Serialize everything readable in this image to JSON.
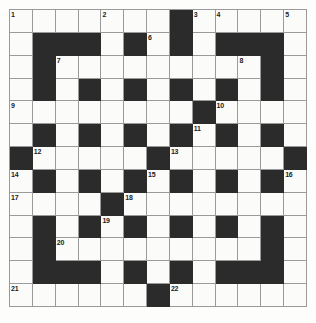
{
  "puzzle": {
    "title": "Crossword Grid",
    "type": "crossword",
    "rows": 13,
    "cols": 13,
    "cell_size": 22.85,
    "colors": {
      "block": "#2b2b2b",
      "open": "#fbfbfa",
      "grid_line": "#9a9a9a",
      "number": "#1b1b1b",
      "page_background": "#fdfdfc"
    },
    "block_count": 69,
    "numbered_cell_count": 22,
    "blocks": [
      [
        0,
        7
      ],
      [
        1,
        1
      ],
      [
        1,
        2
      ],
      [
        1,
        3
      ],
      [
        1,
        5
      ],
      [
        1,
        7
      ],
      [
        1,
        9
      ],
      [
        1,
        10
      ],
      [
        1,
        11
      ],
      [
        2,
        1
      ],
      [
        2,
        11
      ],
      [
        3,
        1
      ],
      [
        3,
        3
      ],
      [
        3,
        5
      ],
      [
        3,
        7
      ],
      [
        3,
        9
      ],
      [
        3,
        11
      ],
      [
        4,
        8
      ],
      [
        5,
        1
      ],
      [
        5,
        3
      ],
      [
        5,
        5
      ],
      [
        5,
        7
      ],
      [
        5,
        9
      ],
      [
        5,
        11
      ],
      [
        6,
        0
      ],
      [
        6,
        6
      ],
      [
        6,
        12
      ],
      [
        7,
        1
      ],
      [
        7,
        3
      ],
      [
        7,
        5
      ],
      [
        7,
        7
      ],
      [
        7,
        9
      ],
      [
        7,
        11
      ],
      [
        8,
        4
      ],
      [
        9,
        1
      ],
      [
        9,
        3
      ],
      [
        9,
        5
      ],
      [
        9,
        7
      ],
      [
        9,
        9
      ],
      [
        9,
        11
      ],
      [
        10,
        1
      ],
      [
        10,
        11
      ],
      [
        11,
        1
      ],
      [
        11,
        2
      ],
      [
        11,
        3
      ],
      [
        11,
        5
      ],
      [
        11,
        7
      ],
      [
        11,
        9
      ],
      [
        11,
        10
      ],
      [
        11,
        11
      ],
      [
        12,
        6
      ]
    ],
    "numbers": [
      {
        "n": "1",
        "row": 0,
        "col": 0
      },
      {
        "n": "2",
        "row": 0,
        "col": 4
      },
      {
        "n": "3",
        "row": 0,
        "col": 8
      },
      {
        "n": "4",
        "row": 0,
        "col": 9
      },
      {
        "n": "5",
        "row": 0,
        "col": 12
      },
      {
        "n": "6",
        "row": 1,
        "col": 6
      },
      {
        "n": "7",
        "row": 2,
        "col": 2
      },
      {
        "n": "8",
        "row": 2,
        "col": 10
      },
      {
        "n": "9",
        "row": 4,
        "col": 0
      },
      {
        "n": "10",
        "row": 4,
        "col": 9
      },
      {
        "n": "11",
        "row": 5,
        "col": 8
      },
      {
        "n": "12",
        "row": 6,
        "col": 1
      },
      {
        "n": "13",
        "row": 6,
        "col": 7
      },
      {
        "n": "14",
        "row": 7,
        "col": 0
      },
      {
        "n": "15",
        "row": 7,
        "col": 6
      },
      {
        "n": "16",
        "row": 7,
        "col": 12
      },
      {
        "n": "17",
        "row": 8,
        "col": 0
      },
      {
        "n": "18",
        "row": 8,
        "col": 5
      },
      {
        "n": "19",
        "row": 9,
        "col": 4
      },
      {
        "n": "20",
        "row": 10,
        "col": 2
      },
      {
        "n": "21",
        "row": 12,
        "col": 0
      },
      {
        "n": "22",
        "row": 12,
        "col": 7
      }
    ],
    "letters": []
  }
}
